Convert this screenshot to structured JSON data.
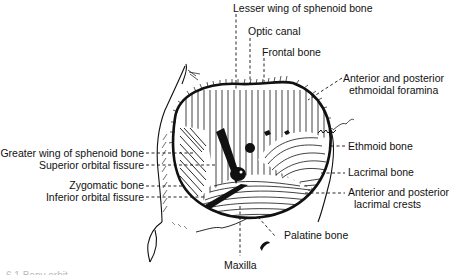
{
  "figure": {
    "labels": {
      "lesser_wing": "Lesser wing of sphenoid bone",
      "optic_canal": "Optic canal",
      "frontal_bone": "Frontal bone",
      "ethmoidal_foramina_1": "Anterior and posterior",
      "ethmoidal_foramina_2": "ethmoidal foramina",
      "greater_wing": "Greater wing of sphenoid bone",
      "superior_orbital_fissure": "Superior orbital fissure",
      "zygomatic_bone": "Zygomatic bone",
      "inferior_orbital_fissure": "Inferior orbital fissure",
      "ethmoid_bone": "Ethmoid bone",
      "lacrimal_bone": "Lacrimal bone",
      "lacrimal_crests_1": "Anterior and posterior",
      "lacrimal_crests_2": "lacrimal crests",
      "palatine_bone": "Palatine bone",
      "maxilla": "Maxilla"
    },
    "caption_fragment": "6.1  Bony orbit"
  },
  "colors": {
    "ink": "#111111",
    "background": "#ffffff"
  }
}
